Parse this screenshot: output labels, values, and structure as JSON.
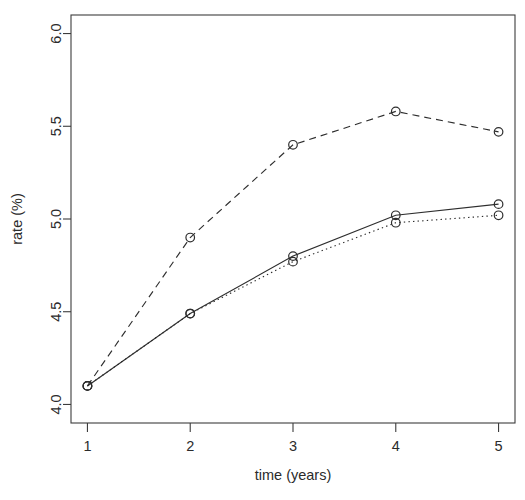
{
  "chart_data": {
    "type": "line",
    "title": "",
    "subtitle": "",
    "xlabel": "time (years)",
    "ylabel": "rate (%)",
    "x": [
      1,
      2,
      3,
      4,
      5
    ],
    "xlim": [
      0.84,
      5.16
    ],
    "ylim": [
      3.9,
      6.1
    ],
    "xticks": [
      "1",
      "2",
      "3",
      "4",
      "5"
    ],
    "yticks": [
      "4.0",
      "4.5",
      "5.0",
      "5.5",
      "6.0"
    ],
    "ytick_values": [
      4.0,
      4.5,
      5.0,
      5.5,
      6.0
    ],
    "grid": false,
    "legend": "none",
    "box": true,
    "series": [
      {
        "name": "dashed",
        "linestyle": "dashed",
        "marker": "circle",
        "color": "#2e2e2e",
        "values": [
          4.1,
          4.9,
          5.4,
          5.58,
          5.47
        ]
      },
      {
        "name": "solid",
        "linestyle": "solid",
        "marker": "circle",
        "color": "#2e2e2e",
        "values": [
          4.1,
          4.49,
          4.8,
          5.02,
          5.08
        ]
      },
      {
        "name": "dotted",
        "linestyle": "dotted",
        "marker": "circle",
        "color": "#2e2e2e",
        "values": [
          4.1,
          4.49,
          4.77,
          4.98,
          5.02
        ]
      }
    ]
  },
  "axes": {
    "x_title": "time (years)",
    "y_title": "rate (%)"
  }
}
